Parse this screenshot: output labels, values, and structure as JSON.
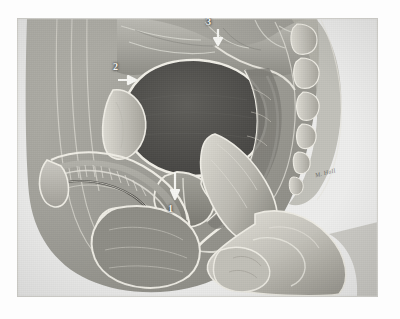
{
  "figure": {
    "kind": "medical-illustration",
    "style": "grayscale airbrush / pencil anatomical plate",
    "background_color": "#fdfdfd",
    "plate_color": "#efefee",
    "plate_rect": {
      "x": 17,
      "y": 18,
      "width": 361,
      "height": 279
    },
    "signature": "M. Hall"
  },
  "labels": [
    {
      "id": "label-1",
      "text": "1",
      "x": 168,
      "y": 190,
      "arrow": "down",
      "target": "prostatic urethra / prostate gland"
    },
    {
      "id": "label-2",
      "text": "2",
      "x": 113,
      "y": 62,
      "arrow": "right",
      "target": "pubic symphysis / retropubic space"
    },
    {
      "id": "label-3",
      "text": "3",
      "x": 206,
      "y": 17,
      "arrow": "down",
      "target": "bladder dome / peritoneal reflection"
    }
  ],
  "palette": {
    "paper": "#efefee",
    "tissue_light": "#d8d7d2",
    "tissue_mid": "#a9a8a3",
    "tissue_dark": "#6e6d69",
    "lumen_dark": "#4b4a47",
    "outline": "#f4f3ef",
    "skin": "#cfcdc6",
    "ink": "#3a3a38"
  },
  "structures": [
    {
      "name": "small-bowel-loops",
      "region": "superior, above bladder"
    },
    {
      "name": "urinary-bladder",
      "region": "central, dark lumen"
    },
    {
      "name": "pubic-symphysis",
      "region": "anterior, label 2"
    },
    {
      "name": "prostate-gland",
      "region": "inferior to bladder, label 1"
    },
    {
      "name": "prostatic-urethra",
      "region": "through prostate"
    },
    {
      "name": "rectum-and-anal-canal",
      "region": "posterior"
    },
    {
      "name": "sacrum-and-coccyx",
      "region": "posterior-right, vertebral bodies"
    },
    {
      "name": "penis-corpora",
      "region": "anterior-inferior shaft"
    },
    {
      "name": "penile-urethra",
      "region": "within shaft"
    },
    {
      "name": "scrotum-and-testis",
      "region": "inferior"
    },
    {
      "name": "examiner-hand",
      "region": "right, gloved hand"
    },
    {
      "name": "index-finger",
      "region": "inserted in rectum palpating prostate"
    }
  ]
}
